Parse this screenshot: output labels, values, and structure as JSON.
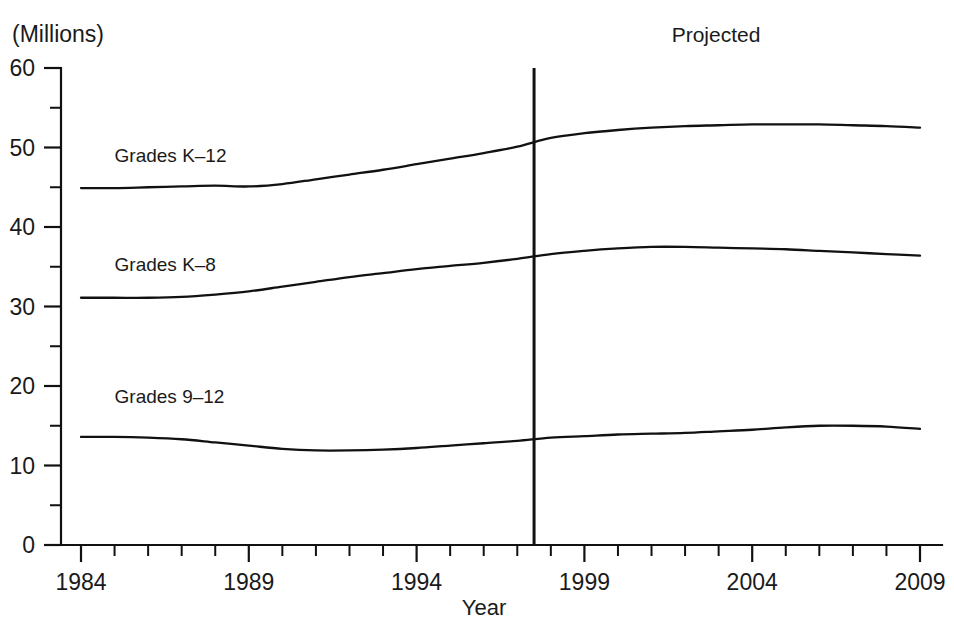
{
  "chart_data": {
    "type": "line",
    "title": "",
    "unit_label": "(Millions)",
    "xlabel": "Year",
    "ylabel": "",
    "ylim": [
      0,
      60
    ],
    "xlim": [
      1984,
      2009
    ],
    "grid": false,
    "legend_position": "inline-labels",
    "y_ticks_major": [
      0,
      10,
      20,
      30,
      40,
      50,
      60
    ],
    "y_ticks_minor": [
      5,
      15,
      25,
      35,
      45,
      55
    ],
    "x_ticks_major": [
      1984,
      1989,
      1994,
      1999,
      2004,
      2009
    ],
    "x_tick_labels": [
      "1984",
      "1989",
      "1994",
      "1999",
      "2004",
      "2009"
    ],
    "x_ticks_all": [
      1984,
      1985,
      1986,
      1987,
      1988,
      1989,
      1990,
      1991,
      1992,
      1993,
      1994,
      1995,
      1996,
      1997,
      1998,
      1999,
      2000,
      2001,
      2002,
      2003,
      2004,
      2005,
      2006,
      2007,
      2008,
      2009
    ],
    "annotations": [
      {
        "text": "Projected",
        "x": 1997.5,
        "note": "label above projected region, right of divider"
      }
    ],
    "divider": {
      "x": 1997.5,
      "label": "projection-start"
    },
    "x": [
      1984,
      1985,
      1986,
      1987,
      1988,
      1989,
      1990,
      1991,
      1992,
      1993,
      1994,
      1995,
      1996,
      1997,
      1998,
      1999,
      2000,
      2001,
      2002,
      2003,
      2004,
      2005,
      2006,
      2007,
      2008,
      2009
    ],
    "series": [
      {
        "name": "Grades K–12",
        "label": "Grades K–12",
        "label_x": 1985.0,
        "label_y": 48.2,
        "values": [
          44.9,
          44.9,
          45.0,
          45.1,
          45.2,
          45.1,
          45.4,
          46.0,
          46.6,
          47.2,
          47.9,
          48.6,
          49.3,
          50.1,
          51.2,
          51.8,
          52.2,
          52.5,
          52.7,
          52.8,
          52.9,
          52.9,
          52.9,
          52.8,
          52.7,
          52.5
        ]
      },
      {
        "name": "Grades K–8",
        "label": "Grades K–8",
        "label_x": 1985.0,
        "label_y": 34.5,
        "values": [
          31.1,
          31.1,
          31.1,
          31.2,
          31.5,
          31.9,
          32.5,
          33.1,
          33.7,
          34.2,
          34.7,
          35.1,
          35.5,
          36.0,
          36.6,
          37.0,
          37.3,
          37.5,
          37.5,
          37.4,
          37.3,
          37.2,
          37.0,
          36.8,
          36.6,
          36.4
        ]
      },
      {
        "name": "Grades 9–12",
        "label": "Grades 9–12",
        "label_x": 1985.0,
        "label_y": 17.8,
        "values": [
          13.6,
          13.6,
          13.5,
          13.3,
          12.9,
          12.5,
          12.1,
          11.9,
          11.9,
          12.0,
          12.2,
          12.5,
          12.8,
          13.1,
          13.5,
          13.7,
          13.9,
          14.0,
          14.1,
          14.3,
          14.5,
          14.8,
          15.0,
          15.0,
          14.9,
          14.6
        ]
      }
    ]
  },
  "colors": {
    "line": "#111111",
    "text": "#1a1a1a",
    "background": "#ffffff"
  }
}
